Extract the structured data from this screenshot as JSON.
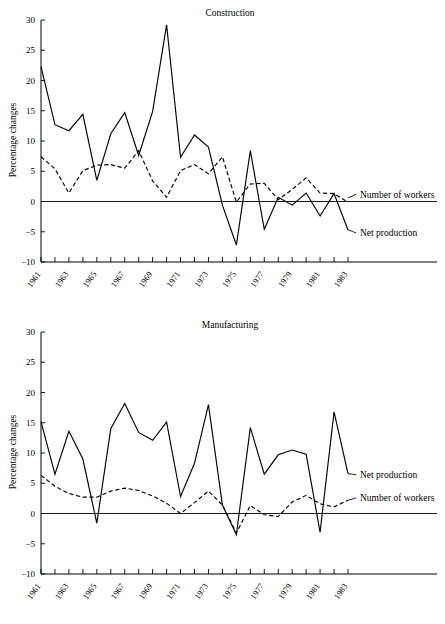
{
  "figure": {
    "background": "#ffffff",
    "ink_color": "#000000"
  },
  "chart_data": [
    {
      "type": "line",
      "title": "Construction",
      "xlabel": "",
      "ylabel": "Percentage changes",
      "xlim": [
        1961,
        1983
      ],
      "ylim": [
        -10,
        30
      ],
      "yticks": [
        -10,
        -5,
        0,
        5,
        10,
        15,
        20,
        25,
        30
      ],
      "ytick_labels": [
        "−10",
        "−5",
        "0",
        "5",
        "10",
        "15",
        "20",
        "25",
        "30"
      ],
      "xticks": [
        1961,
        1962,
        1963,
        1964,
        1965,
        1966,
        1967,
        1968,
        1969,
        1970,
        1971,
        1972,
        1973,
        1974,
        1975,
        1976,
        1977,
        1978,
        1979,
        1980,
        1981,
        1982,
        1983
      ],
      "xtick_labels_shown": [
        "1961",
        "1963",
        "1965",
        "1967",
        "1969",
        "1971",
        "1973",
        "1975",
        "1977",
        "1979",
        "1981",
        "1983"
      ],
      "grid": false,
      "legend_position": "inline-right-annotations",
      "x": [
        1961,
        1962,
        1963,
        1964,
        1965,
        1966,
        1967,
        1968,
        1969,
        1970,
        1971,
        1972,
        1973,
        1974,
        1975,
        1976,
        1977,
        1978,
        1979,
        1980,
        1981,
        1982,
        1983
      ],
      "series": [
        {
          "name": "Net production",
          "style": "solid",
          "values": [
            22.3,
            12.7,
            11.7,
            14.4,
            3.5,
            11.2,
            14.7,
            7.6,
            14.9,
            29.2,
            7.3,
            11.0,
            9.0,
            -0.6,
            -7.2,
            8.4,
            -4.6,
            0.7,
            -0.6,
            1.4,
            -2.4,
            1.3,
            -4.7
          ]
        },
        {
          "name": "Number of workers",
          "style": "dashed",
          "values": [
            7.4,
            5.4,
            1.4,
            5.1,
            6.0,
            6.1,
            5.5,
            8.4,
            3.4,
            0.7,
            5.1,
            6.1,
            4.6,
            7.4,
            -0.1,
            2.9,
            3.0,
            0.3,
            2.0,
            3.9,
            1.4,
            1.3,
            -0.1
          ]
        }
      ],
      "annotations": [
        {
          "text": "Number of workers",
          "near_year": 1983,
          "near_value": 0.6
        },
        {
          "text": "Net production",
          "near_year": 1983,
          "near_value": -4.7
        }
      ]
    },
    {
      "type": "line",
      "title": "Manufacturing",
      "xlabel": "",
      "ylabel": "Percentage changes",
      "xlim": [
        1961,
        1983
      ],
      "ylim": [
        -10,
        30
      ],
      "yticks": [
        -10,
        -5,
        0,
        5,
        10,
        15,
        20,
        25,
        30
      ],
      "ytick_labels": [
        "−10",
        "−5",
        "0",
        "5",
        "10",
        "15",
        "20",
        "25",
        "30"
      ],
      "xticks": [
        1961,
        1962,
        1963,
        1964,
        1965,
        1966,
        1967,
        1968,
        1969,
        1970,
        1971,
        1972,
        1973,
        1974,
        1975,
        1976,
        1977,
        1978,
        1979,
        1980,
        1981,
        1982,
        1983
      ],
      "xtick_labels_shown": [
        "1961",
        "1963",
        "1965",
        "1967",
        "1969",
        "1971",
        "1973",
        "1975",
        "1977",
        "1979",
        "1981",
        "1983"
      ],
      "grid": false,
      "legend_position": "inline-right-annotations",
      "x": [
        1961,
        1962,
        1963,
        1964,
        1965,
        1966,
        1967,
        1968,
        1969,
        1970,
        1971,
        1972,
        1973,
        1974,
        1975,
        1976,
        1977,
        1978,
        1979,
        1980,
        1981,
        1982,
        1983
      ],
      "series": [
        {
          "name": "Net production",
          "style": "solid",
          "values": [
            15.2,
            6.5,
            13.6,
            9.0,
            -1.6,
            14.0,
            18.2,
            13.4,
            12.1,
            15.1,
            2.8,
            8.3,
            18.0,
            1.4,
            -3.5,
            14.2,
            6.5,
            9.7,
            10.5,
            9.8,
            -3.1,
            16.8,
            6.6
          ]
        },
        {
          "name": "Number of workers",
          "style": "dashed",
          "values": [
            6.3,
            4.5,
            3.3,
            2.7,
            2.7,
            3.7,
            4.2,
            3.8,
            2.9,
            1.7,
            0.0,
            1.8,
            3.7,
            1.4,
            -3.2,
            1.3,
            -0.2,
            -0.5,
            1.9,
            3.0,
            1.6,
            1.1,
            2.2
          ]
        }
      ],
      "annotations": [
        {
          "text": "Net production",
          "near_year": 1983,
          "near_value": 6.6
        },
        {
          "text": "Number of workers",
          "near_year": 1983,
          "near_value": 2.2
        }
      ]
    }
  ]
}
